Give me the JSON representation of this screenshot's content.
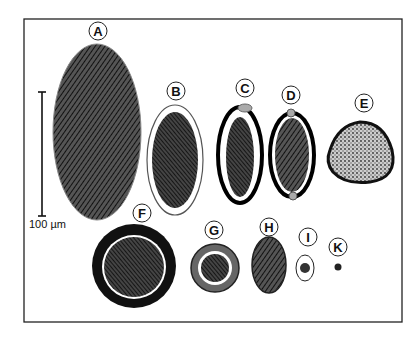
{
  "figure": {
    "type": "egg size comparison diagram",
    "scale_bar": {
      "label": "100 µm"
    },
    "specimens": [
      {
        "id": "A",
        "label": "A",
        "shape": "large ellipse, heavily hatched"
      },
      {
        "id": "B",
        "label": "B",
        "shape": "ellipse with thin shell, lobed contents"
      },
      {
        "id": "C",
        "label": "C",
        "shape": "thick-shelled ellipse with operculum"
      },
      {
        "id": "D",
        "label": "D",
        "shape": "lemon-shaped with polar plugs"
      },
      {
        "id": "E",
        "label": "E",
        "shape": "triangular rounded, stippled"
      },
      {
        "id": "F",
        "label": "F",
        "shape": "round, thick dark shell"
      },
      {
        "id": "G",
        "label": "G",
        "shape": "round, striated shell"
      },
      {
        "id": "H",
        "label": "H",
        "shape": "oval, hatched"
      },
      {
        "id": "I",
        "label": "I",
        "shape": "small oval with dark embryo"
      },
      {
        "id": "K",
        "label": "K",
        "shape": "tiny dark dot"
      }
    ]
  }
}
